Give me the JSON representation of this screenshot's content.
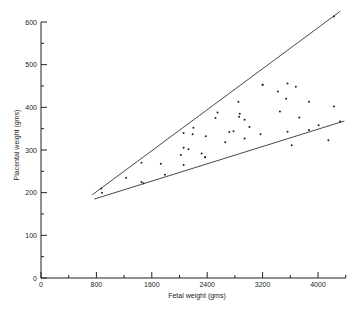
{
  "chart_data": {
    "type": "scatter",
    "title": "",
    "xlabel": "Fetal weight (gms)",
    "ylabel": "Placental weight (gms)",
    "xlim": [
      0,
      4400
    ],
    "ylim": [
      0,
      600
    ],
    "xticks": [
      0,
      800,
      1600,
      2400,
      3200,
      4000
    ],
    "yticks": [
      0,
      100,
      200,
      300,
      400,
      500,
      600
    ],
    "grid": false,
    "legend": null,
    "series": [
      {
        "name": "observations",
        "points": [
          [
            870,
            210
          ],
          [
            880,
            200
          ],
          [
            1230,
            235
          ],
          [
            1450,
            225
          ],
          [
            1480,
            222
          ],
          [
            1450,
            270
          ],
          [
            1730,
            268
          ],
          [
            1790,
            242
          ],
          [
            2060,
            340
          ],
          [
            2190,
            337
          ],
          [
            2200,
            352
          ],
          [
            2380,
            332
          ],
          [
            2060,
            305
          ],
          [
            2130,
            302
          ],
          [
            2020,
            288
          ],
          [
            2320,
            292
          ],
          [
            2370,
            283
          ],
          [
            2060,
            265
          ],
          [
            2550,
            388
          ],
          [
            2520,
            375
          ],
          [
            2850,
            413
          ],
          [
            2870,
            385
          ],
          [
            2860,
            378
          ],
          [
            2940,
            371
          ],
          [
            3010,
            354
          ],
          [
            2720,
            342
          ],
          [
            2780,
            344
          ],
          [
            2940,
            327
          ],
          [
            3170,
            337
          ],
          [
            2660,
            318
          ],
          [
            2370,
            283
          ],
          [
            3200,
            453
          ],
          [
            3420,
            437
          ],
          [
            3560,
            456
          ],
          [
            3680,
            448
          ],
          [
            3540,
            420
          ],
          [
            3870,
            413
          ],
          [
            4230,
            402
          ],
          [
            3200,
            453
          ],
          [
            3450,
            390
          ],
          [
            3730,
            376
          ],
          [
            3560,
            343
          ],
          [
            3870,
            347
          ],
          [
            4010,
            358
          ],
          [
            4320,
            367
          ],
          [
            4150,
            323
          ],
          [
            3620,
            311
          ],
          [
            4230,
            613
          ]
        ]
      }
    ],
    "lines": [
      {
        "name": "upper-bound",
        "from": [
          740,
          195
        ],
        "to": [
          4320,
          625
        ]
      },
      {
        "name": "lower-bound",
        "from": [
          770,
          185
        ],
        "to": [
          4380,
          368
        ]
      }
    ]
  }
}
